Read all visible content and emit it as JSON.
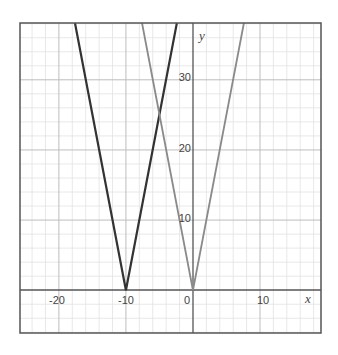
{
  "chart_data": {
    "type": "line",
    "title": "",
    "xlabel": "x",
    "ylabel": "y",
    "xlim": [
      -25.8,
      19.1
    ],
    "ylim": [
      -6.1,
      38.1
    ],
    "grid": true,
    "grid_major_step": 10,
    "grid_minor_step": 2,
    "x_ticks": [
      -20,
      -10,
      0,
      10
    ],
    "x_tick_labels": [
      "-20",
      "-10",
      "0",
      "10"
    ],
    "y_ticks": [
      10,
      20,
      30
    ],
    "y_tick_labels": [
      "10",
      "20",
      "30"
    ],
    "legend": null,
    "series": [
      {
        "name": "y = 5|x + 10|",
        "color": "#333333",
        "points": [
          [
            -17.6,
            38.1
          ],
          [
            -10,
            0
          ],
          [
            -2.4,
            38.1
          ]
        ]
      },
      {
        "name": "y = 5|x|",
        "color": "#8a8a8a",
        "points": [
          [
            -7.6,
            38.1
          ],
          [
            0,
            0
          ],
          [
            7.6,
            38.1
          ]
        ]
      }
    ],
    "annotations": []
  },
  "colors": {
    "axis": "#555555",
    "frame": "#555555",
    "grid_major": "#bdbdbd",
    "grid_minor": "#e2e2e2",
    "series_dark": "#333333",
    "series_light": "#8a8a8a"
  },
  "axes": {
    "x_title": "x",
    "y_title": "y",
    "x_labels": {
      "neg20": "-20",
      "neg10": "-10",
      "zero": "0",
      "pos10": "10"
    },
    "y_labels": {
      "pos10": "10",
      "pos20": "20",
      "pos30": "30"
    }
  }
}
